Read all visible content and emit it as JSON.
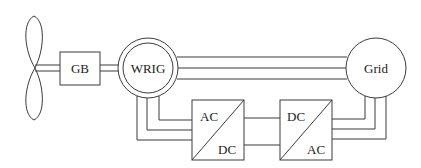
{
  "diagram": {
    "type": "DFIG wind turbine topology",
    "blocks": {
      "turbine": {
        "label": ""
      },
      "gearbox": {
        "label": "GB"
      },
      "generator": {
        "label": "WRIG"
      },
      "grid": {
        "label": "Grid"
      },
      "rotor_side_converter": {
        "top_label": "AC",
        "bottom_label": "DC"
      },
      "grid_side_converter": {
        "top_label": "DC",
        "bottom_label": "AC"
      }
    },
    "connections": [
      {
        "from": "turbine",
        "to": "gearbox",
        "kind": "shaft"
      },
      {
        "from": "gearbox",
        "to": "generator",
        "kind": "shaft"
      },
      {
        "from": "generator",
        "to": "grid",
        "kind": "stator three-phase"
      },
      {
        "from": "generator",
        "to": "rotor_side_converter",
        "kind": "rotor three-phase"
      },
      {
        "from": "rotor_side_converter",
        "to": "grid_side_converter",
        "kind": "dc link"
      },
      {
        "from": "grid_side_converter",
        "to": "grid",
        "kind": "three-phase"
      }
    ],
    "colors": {
      "stroke": "#3a3a3a",
      "background": "#ffffff",
      "text": "#222222"
    }
  }
}
